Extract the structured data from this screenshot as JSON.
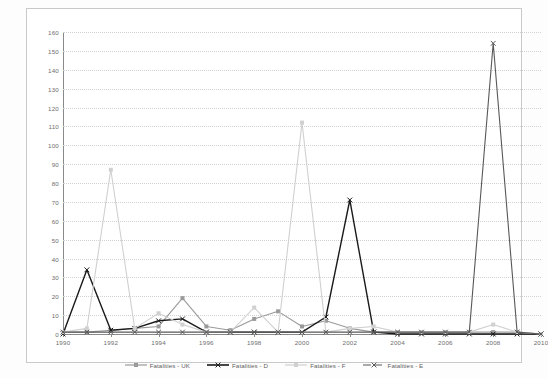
{
  "chart_data": {
    "type": "line",
    "title": "",
    "subtitle": "",
    "xlabel": "",
    "ylabel": "",
    "xlim": [
      1990,
      2010
    ],
    "ylim": [
      0,
      160
    ],
    "ytick_step": 10,
    "grid": true,
    "legend_position": "bottom",
    "x": [
      1990,
      1991,
      1992,
      1993,
      1994,
      1995,
      1996,
      1997,
      1998,
      1999,
      2000,
      2001,
      2002,
      2003,
      2004,
      2005,
      2006,
      2007,
      2008,
      2009,
      2010
    ],
    "xtick_labels": [
      "1990",
      "1992",
      "1994",
      "1996",
      "1998",
      "2000",
      "2002",
      "2004",
      "2006",
      "2008",
      "2010"
    ],
    "ytick_labels": [
      "0",
      "10",
      "20",
      "30",
      "40",
      "50",
      "60",
      "70",
      "80",
      "90",
      "100",
      "110",
      "120",
      "130",
      "140",
      "150",
      "160"
    ],
    "series": [
      {
        "name": "Fatalities - UK",
        "color": "#9a9a9a",
        "marker": "square",
        "values": [
          1,
          1,
          2,
          3,
          4,
          19,
          4,
          2,
          8,
          12,
          4,
          7,
          3,
          1,
          1,
          1,
          1,
          1,
          1,
          1,
          0
        ]
      },
      {
        "name": "Fatalities - D",
        "color": "#1a1a1a",
        "marker": "cross",
        "values": [
          0,
          34,
          2,
          3,
          7,
          8,
          1,
          1,
          1,
          1,
          1,
          9,
          71,
          1,
          0,
          0,
          0,
          0,
          0,
          0,
          0
        ]
      },
      {
        "name": "Fatalities - F",
        "color": "#d0d0d0",
        "marker": "square",
        "values": [
          1,
          3,
          87,
          3,
          11,
          5,
          1,
          1,
          14,
          1,
          112,
          1,
          3,
          4,
          1,
          1,
          1,
          1,
          5,
          1,
          0
        ]
      },
      {
        "name": "Fatalities - E",
        "color": "#585858",
        "marker": "cross",
        "values": [
          1,
          1,
          1,
          1,
          1,
          1,
          1,
          1,
          1,
          1,
          1,
          1,
          1,
          1,
          1,
          1,
          1,
          1,
          154,
          1,
          0
        ]
      }
    ]
  }
}
